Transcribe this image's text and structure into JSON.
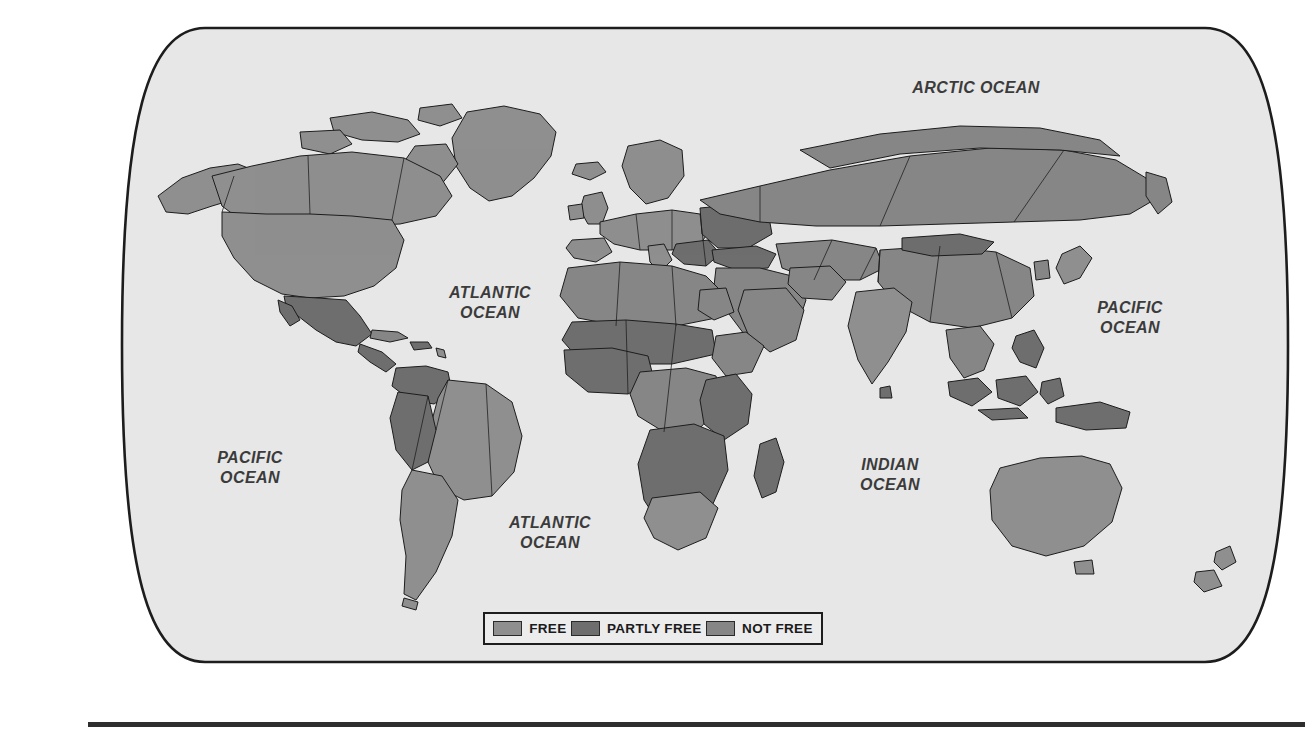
{
  "figure": {
    "kind": "world-map",
    "projection": "robinson"
  },
  "colors": {
    "ocean": "#e7e7e8",
    "border": "#1d1d1d",
    "free": "#8f8f8f",
    "partly_free": "#6e6e6e",
    "not_free": "#868686",
    "country_outline": "#1d1d1d",
    "label_text": "#3b3b3b",
    "rule": "#2e2e2e"
  },
  "ocean_labels": [
    {
      "id": "arctic",
      "text": "ARCTIC OCEAN"
    },
    {
      "id": "atlantic_n",
      "text": "ATLANTIC\nOCEAN"
    },
    {
      "id": "pacific_w",
      "text": "PACIFIC\nOCEAN"
    },
    {
      "id": "pacific_e",
      "text": "PACIFIC\nOCEAN"
    },
    {
      "id": "atlantic_s",
      "text": "ATLANTIC\nOCEAN"
    },
    {
      "id": "indian",
      "text": "INDIAN\nOCEAN"
    }
  ],
  "legend": {
    "items": [
      {
        "label": "FREE",
        "color": "#8f8f8f"
      },
      {
        "label": "PARTLY FREE",
        "color": "#6e6e6e"
      },
      {
        "label": "NOT FREE",
        "color": "#868686"
      }
    ]
  }
}
